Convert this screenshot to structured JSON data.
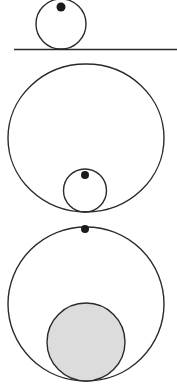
{
  "diagram": {
    "colors": {
      "stroke": "#2a2a2a",
      "dot": "#1a1a1a",
      "shade": "#dcdcdc",
      "background": "#ffffff"
    },
    "panels": [
      {
        "id": "circle-on-line",
        "line": {
          "x1": 14,
          "y1": 49.5,
          "x2": 177,
          "y2": 49.5
        },
        "circle": {
          "cx": 61,
          "cy": 24,
          "r": 25
        },
        "dot": {
          "cx": 61,
          "cy": 7,
          "r": 4.5
        }
      },
      {
        "id": "small-circle-in-circle",
        "outer": {
          "cx": 86,
          "cy": 138,
          "rx": 78,
          "ry": 74
        },
        "inner": {
          "cx": 85,
          "cy": 190.5,
          "r": 21.5
        },
        "dot": {
          "cx": 85,
          "cy": 175,
          "r": 4
        }
      },
      {
        "id": "large-shaded-circle-in-circle",
        "outer": {
          "cx": 86,
          "cy": 304,
          "rx": 78,
          "ry": 77
        },
        "inner": {
          "cx": 86,
          "cy": 342,
          "r": 39
        },
        "dot": {
          "cx": 85,
          "cy": 229,
          "r": 4
        }
      }
    ]
  }
}
